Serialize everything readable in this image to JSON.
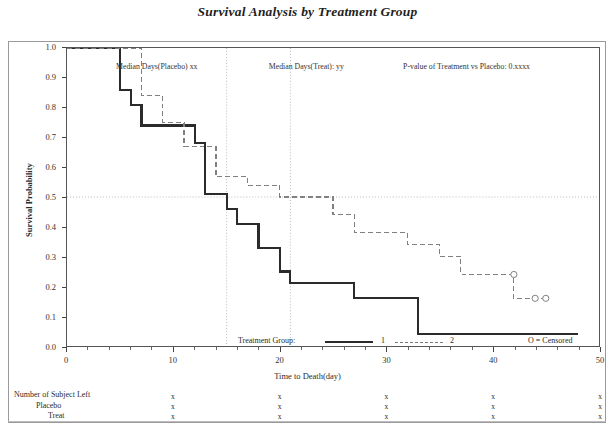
{
  "chart_data": {
    "type": "line",
    "title": "Survival Analysis by Treatment Group",
    "xlabel": "Time to Death(day)",
    "ylabel": "Survival Probability",
    "xlim": [
      0,
      50
    ],
    "ylim": [
      0.0,
      1.0
    ],
    "grid": false,
    "xticks": [
      0,
      10,
      20,
      30,
      40,
      50
    ],
    "xtick_labels": [
      "0",
      "10",
      "20",
      "30",
      "40",
      "50"
    ],
    "yticks": [
      0.0,
      0.1,
      0.2,
      0.3,
      0.4,
      0.5,
      0.6,
      0.7,
      0.8,
      0.9,
      1.0
    ],
    "ytick_labels": [
      "0.0",
      "0.1",
      "0.2",
      "0.3",
      "0.4",
      "0.5",
      "0.6",
      "0.7",
      "0.8",
      "0.9",
      "1.0"
    ],
    "legend_position": "bottom-center",
    "legend_title": "Treatment Group:",
    "series": [
      {
        "name": "1",
        "label": "1",
        "style": "solid",
        "color": "#2b2b2b",
        "censored_points": [],
        "steps": [
          {
            "t": 0,
            "s": 1.0
          },
          {
            "t": 5,
            "s": 1.0
          },
          {
            "t": 5,
            "s": 0.86
          },
          {
            "t": 6,
            "s": 0.86
          },
          {
            "t": 6,
            "s": 0.81
          },
          {
            "t": 7,
            "s": 0.81
          },
          {
            "t": 7,
            "s": 0.74
          },
          {
            "t": 12,
            "s": 0.74
          },
          {
            "t": 12,
            "s": 0.68
          },
          {
            "t": 13,
            "s": 0.68
          },
          {
            "t": 13,
            "s": 0.51
          },
          {
            "t": 15,
            "s": 0.51
          },
          {
            "t": 15,
            "s": 0.46
          },
          {
            "t": 16,
            "s": 0.46
          },
          {
            "t": 16,
            "s": 0.41
          },
          {
            "t": 18,
            "s": 0.41
          },
          {
            "t": 18,
            "s": 0.33
          },
          {
            "t": 20,
            "s": 0.33
          },
          {
            "t": 20,
            "s": 0.25
          },
          {
            "t": 21,
            "s": 0.25
          },
          {
            "t": 21,
            "s": 0.21
          },
          {
            "t": 27,
            "s": 0.21
          },
          {
            "t": 27,
            "s": 0.16
          },
          {
            "t": 33,
            "s": 0.16
          },
          {
            "t": 33,
            "s": 0.04
          },
          {
            "t": 48,
            "s": 0.04
          }
        ]
      },
      {
        "name": "2",
        "label": "2",
        "style": "dashed",
        "color": "#808080",
        "censored_points": [
          {
            "t": 42,
            "s": 0.24
          },
          {
            "t": 44,
            "s": 0.16
          },
          {
            "t": 45,
            "s": 0.16
          }
        ],
        "steps": [
          {
            "t": 0,
            "s": 1.0
          },
          {
            "t": 7,
            "s": 1.0
          },
          {
            "t": 7,
            "s": 0.84
          },
          {
            "t": 9,
            "s": 0.84
          },
          {
            "t": 9,
            "s": 0.75
          },
          {
            "t": 11,
            "s": 0.75
          },
          {
            "t": 11,
            "s": 0.67
          },
          {
            "t": 14,
            "s": 0.67
          },
          {
            "t": 14,
            "s": 0.57
          },
          {
            "t": 17,
            "s": 0.57
          },
          {
            "t": 17,
            "s": 0.54
          },
          {
            "t": 20,
            "s": 0.54
          },
          {
            "t": 20,
            "s": 0.5
          },
          {
            "t": 25,
            "s": 0.5
          },
          {
            "t": 25,
            "s": 0.44
          },
          {
            "t": 27,
            "s": 0.44
          },
          {
            "t": 27,
            "s": 0.38
          },
          {
            "t": 32,
            "s": 0.38
          },
          {
            "t": 32,
            "s": 0.34
          },
          {
            "t": 35,
            "s": 0.34
          },
          {
            "t": 35,
            "s": 0.3
          },
          {
            "t": 37,
            "s": 0.3
          },
          {
            "t": 37,
            "s": 0.24
          },
          {
            "t": 42,
            "s": 0.24
          },
          {
            "t": 42,
            "s": 0.16
          },
          {
            "t": 45,
            "s": 0.16
          }
        ]
      }
    ],
    "reference_lines": {
      "horizontal": [
        {
          "value": 0.5,
          "style": "dotted"
        }
      ],
      "vertical": [
        {
          "value": 15,
          "style": "dotted"
        },
        {
          "value": 21,
          "style": "dotted"
        }
      ]
    },
    "annotations": [
      {
        "text": "Median Days(Placebo) xx",
        "x": 8.5,
        "y": 0.935
      },
      {
        "text": "Median Days(Treat): yy",
        "x": 22.5,
        "y": 0.935
      },
      {
        "text": "P-value of Treatment vs Placebo: 0.xxxx",
        "x": 37.5,
        "y": 0.935
      }
    ]
  },
  "legend": {
    "title": "Treatment Group:",
    "entry_1": "1",
    "entry_2": "2",
    "censored_note": "O = Censored"
  },
  "risk_table": {
    "header": "Number of Subject Left",
    "rows": [
      {
        "label": "Placebo",
        "values": [
          "x",
          "x",
          "x",
          "x",
          "x"
        ]
      },
      {
        "label": "Treat",
        "values": [
          "x",
          "x",
          "x",
          "x",
          "x"
        ]
      }
    ],
    "header_values": [
      "x",
      "x",
      "x",
      "x",
      "x"
    ],
    "value_positions": [
      10,
      20,
      30,
      40,
      50
    ]
  },
  "colors": {
    "group1": "#2b2b2b",
    "group2": "#808080",
    "frame": "#9a9a9a",
    "axis": "#555555",
    "text": "#2b2b2b",
    "reference_line": "#aaaaaa"
  }
}
